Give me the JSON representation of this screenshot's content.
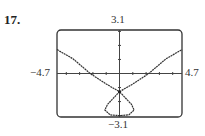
{
  "problem": {
    "number": "17."
  },
  "window": {
    "xmin_label": "−4.7",
    "xmax_label": "4.7",
    "ymin_label": "−3.1",
    "ymax_label": "3.1"
  },
  "chart_data": {
    "type": "line",
    "title": "",
    "xlabel": "",
    "ylabel": "",
    "xlim": [
      -4.7,
      4.7
    ],
    "ylim": [
      -3.1,
      3.1
    ],
    "grid": false,
    "tick_step": 1,
    "series": [
      {
        "name": "curve",
        "description": "strophoid-like curve with a self-intersection near (0, -1.3), a closed loop below down to about y = -3.0, and two branches rising to the upper left and upper right",
        "points": [
          [
            -4.7,
            1.7
          ],
          [
            -3.5,
            1.05
          ],
          [
            -2.2,
            0.0
          ],
          [
            -1.0,
            -0.75
          ],
          [
            0.0,
            -1.3
          ],
          [
            -0.9,
            -2.2
          ],
          [
            -1.1,
            -2.6
          ],
          [
            -0.7,
            -2.95
          ],
          [
            0.0,
            -3.0
          ],
          [
            0.7,
            -2.95
          ],
          [
            1.1,
            -2.6
          ],
          [
            0.9,
            -2.2
          ],
          [
            0.0,
            -1.3
          ],
          [
            1.0,
            -0.75
          ],
          [
            2.2,
            0.0
          ],
          [
            3.5,
            1.05
          ],
          [
            4.7,
            1.7
          ]
        ]
      }
    ],
    "annotations": [
      {
        "label": "crossing point",
        "x": 0.0,
        "y": -1.3
      }
    ]
  }
}
